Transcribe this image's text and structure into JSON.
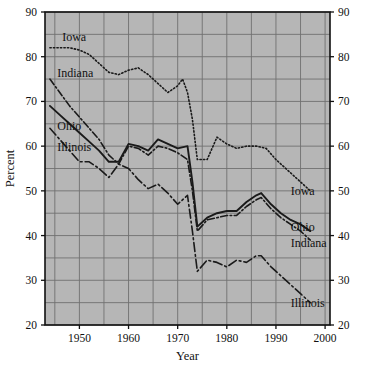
{
  "chart_data": {
    "type": "line",
    "title": "",
    "xlabel": "Year",
    "ylabel": "Percent",
    "xlim": [
      1943,
      2001
    ],
    "ylim": [
      20,
      90
    ],
    "xticks": [
      1950,
      1960,
      1970,
      1980,
      1990,
      2000
    ],
    "xtick_labels": [
      "1950",
      "1960",
      "1970",
      "1980",
      "1990",
      "2000"
    ],
    "yticks": [
      20,
      30,
      40,
      50,
      60,
      70,
      80,
      90
    ],
    "ytick_labels": [
      "20",
      "30",
      "40",
      "50",
      "60",
      "70",
      "80",
      "90"
    ],
    "y_axis_right": true,
    "grid": true,
    "grid_minor_x_step": 5,
    "grid_minor_y_step": 5,
    "plot_bgcolor": "#b6b6b6",
    "grid_color": "#707070",
    "line_color": "#1a1a1a",
    "legend_position": "inline-annotations",
    "series": [
      {
        "name": "Iowa",
        "style": "dotted",
        "label_left": "Iowa",
        "label_right": "Iowa",
        "x": [
          1944,
          1946,
          1948,
          1950,
          1952,
          1954,
          1956,
          1958,
          1960,
          1962,
          1964,
          1966,
          1968,
          1970,
          1971,
          1972,
          1973,
          1974,
          1976,
          1978,
          1980,
          1982,
          1984,
          1986,
          1988,
          1990,
          1992,
          1994,
          1996,
          1997
        ],
        "values": [
          82,
          82,
          82,
          81.5,
          80.5,
          78.5,
          76.5,
          76,
          77,
          77.5,
          76,
          74,
          72,
          73.5,
          75,
          72,
          66,
          57,
          57,
          62,
          60.5,
          59.5,
          60,
          60,
          59.5,
          57,
          55,
          53,
          51,
          50
        ]
      },
      {
        "name": "Indiana",
        "style": "dash-dot",
        "label_left": "Indiana",
        "label_right": "Indiana",
        "x": [
          1944,
          1946,
          1948,
          1950,
          1952,
          1954,
          1956,
          1958,
          1960,
          1962,
          1964,
          1966,
          1968,
          1970,
          1972,
          1973,
          1974,
          1976,
          1978,
          1980,
          1982,
          1984,
          1986,
          1987,
          1989,
          1991,
          1993,
          1995,
          1997
        ],
        "values": [
          75,
          72,
          69,
          66.5,
          64,
          61.5,
          58,
          56,
          60,
          59.5,
          58,
          60,
          59.5,
          58.5,
          57,
          50,
          41,
          43.5,
          44,
          44.5,
          44.5,
          46.5,
          48,
          48.5,
          46,
          44,
          42.5,
          41,
          39
        ]
      },
      {
        "name": "Ohio",
        "style": "solid",
        "label_left": "Ohio",
        "label_right": "Ohio",
        "x": [
          1944,
          1946,
          1948,
          1950,
          1952,
          1954,
          1956,
          1958,
          1960,
          1962,
          1964,
          1966,
          1968,
          1970,
          1972,
          1973,
          1974,
          1976,
          1978,
          1980,
          1982,
          1984,
          1986,
          1987,
          1989,
          1991,
          1993,
          1995,
          1997
        ],
        "values": [
          69,
          67,
          65,
          63,
          61,
          59,
          56.5,
          56.5,
          60.5,
          60,
          59,
          61.5,
          60.5,
          59.5,
          60,
          52,
          42,
          44,
          45,
          45.5,
          45.5,
          47.5,
          49,
          49.5,
          47,
          45,
          43.5,
          42.5,
          41
        ]
      },
      {
        "name": "Illinois",
        "style": "long-dash-dot",
        "label_left": "Illinois",
        "label_right": "Illinois",
        "x": [
          1944,
          1946,
          1948,
          1950,
          1952,
          1954,
          1956,
          1958,
          1960,
          1962,
          1964,
          1966,
          1968,
          1970,
          1972,
          1973,
          1974,
          1976,
          1978,
          1980,
          1982,
          1984,
          1986,
          1987,
          1989,
          1991,
          1993,
          1995,
          1997
        ],
        "values": [
          64,
          61.5,
          59,
          56.5,
          56.5,
          55,
          53,
          56,
          55,
          52.5,
          50.5,
          51.5,
          49.5,
          47,
          49,
          41,
          32,
          34.5,
          34,
          33,
          34.5,
          34,
          35.5,
          35.5,
          33,
          31,
          29,
          27,
          25
        ]
      }
    ],
    "inline_labels": [
      {
        "text": "Iowa",
        "x": 1946.5,
        "y": 83.5,
        "anchor": "start"
      },
      {
        "text": "Indiana",
        "x": 1945.5,
        "y": 75.5,
        "anchor": "start"
      },
      {
        "text": "Ohio",
        "x": 1945.5,
        "y": 63.5,
        "anchor": "start"
      },
      {
        "text": "Illinois",
        "x": 1945.5,
        "y": 59.0,
        "anchor": "start"
      },
      {
        "text": "Iowa",
        "x": 1993.0,
        "y": 49.0,
        "anchor": "start"
      },
      {
        "text": "Ohio",
        "x": 1993.0,
        "y": 41.0,
        "anchor": "start"
      },
      {
        "text": "Indiana",
        "x": 1993.0,
        "y": 37.5,
        "anchor": "start"
      },
      {
        "text": "Illinois",
        "x": 1993.0,
        "y": 24.0,
        "anchor": "start"
      }
    ]
  }
}
